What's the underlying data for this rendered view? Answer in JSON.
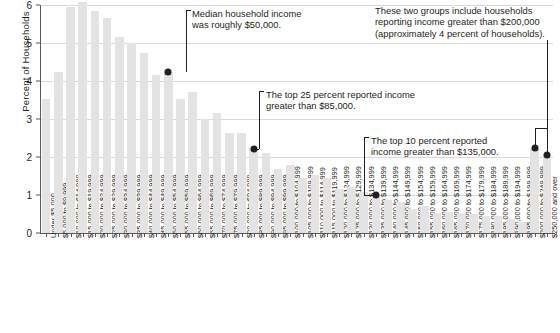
{
  "chart_data": {
    "type": "bar",
    "title": "",
    "xlabel": "",
    "ylabel": "Percent of Households",
    "ylim": [
      0,
      6
    ],
    "yticks": [
      0,
      1,
      2,
      3,
      4,
      5,
      6
    ],
    "ytick_labels": [
      "0",
      "1",
      "2",
      "3",
      "4",
      "5",
      "6"
    ],
    "grid": true,
    "legend": "none",
    "categories": [
      "Under $5,000",
      "$5,000 to $9,999",
      "$10,000 to $14,999",
      "$15,000 to $19,999",
      "$20,000 to $24,999",
      "$25,000 to $29,999",
      "$30,000 to $34,999",
      "$35,000 to $39,999",
      "$40,000 to $44,999",
      "$45,000 to $49,999",
      "$50,000 to $54,999",
      "$55,000 to $59,999",
      "$60,000 to $64,999",
      "$65,000 to $69,999",
      "$70,000 to $74,999",
      "$75,000 to $79,999",
      "$80,000 to $84,999",
      "$85,000 to $89,999",
      "$90,000 to $94,999",
      "$95,000 to $99,999",
      "$100,000 to $104,999",
      "$105,000 to $109,999",
      "$110,000 to $114,999",
      "$115,000 to $119,999",
      "$120,000 to $124,999",
      "$125,000 to $129,999",
      "$130,000 to $134,999",
      "$135,000 to $139,999",
      "$140,000 to $144,999",
      "$145,000 to $149,999",
      "$150,000 to $154,999",
      "$155,000 to $159,999",
      "$160,000 to $164,999",
      "$165,000 to $169,999",
      "$170,000 to $174,999",
      "$175,000 to $179,999",
      "$180,000 to $184,999",
      "$185,000 to $189,999",
      "$190,000 to $194,999",
      "$195,000 to $199,999",
      "$200,000 to $249,999",
      "$250,000 and over"
    ],
    "values": [
      3.52,
      4.25,
      5.96,
      6.07,
      5.84,
      5.66,
      5.17,
      5.0,
      4.73,
      4.15,
      4.25,
      3.53,
      3.7,
      3.0,
      3.15,
      2.62,
      2.64,
      2.21,
      2.1,
      1.69,
      1.8,
      1.44,
      1.52,
      1.45,
      1.16,
      1.2,
      1.07,
      1.0,
      0.86,
      0.82,
      0.63,
      0.7,
      0.52,
      0.55,
      0.52,
      0.5,
      0.45,
      0.44,
      0.38,
      0.3,
      2.23,
      2.05
    ],
    "bar_color": "#e3e3e3",
    "annotations": [
      {
        "id": "median-annotation",
        "lines": [
          "Median household income",
          "was roughly $50,000."
        ],
        "marker_category": "$50,000 to $54,999",
        "marker_value": 4.25
      },
      {
        "id": "top25-annotation",
        "lines": [
          "The top 25 percent reported income",
          "greater than $85,000."
        ],
        "marker_category": "$85,000 to $89,999",
        "marker_value": 2.21
      },
      {
        "id": "top10-annotation",
        "lines": [
          "The top 10 percent reported",
          "income greater than $135,000."
        ],
        "marker_category": "$135,000 to $139,999",
        "marker_value": 1.0
      },
      {
        "id": "top-groups-annotation",
        "lines": [
          "These two groups include households",
          "reporting income greater than $200,000",
          "(approximately 4 percent of households)."
        ],
        "marker_categories": [
          "$200,000 to $249,999",
          "$250,000 and over"
        ],
        "marker_values": [
          2.23,
          2.05
        ]
      }
    ]
  },
  "axis": {
    "y_title": "Percent of Households"
  }
}
